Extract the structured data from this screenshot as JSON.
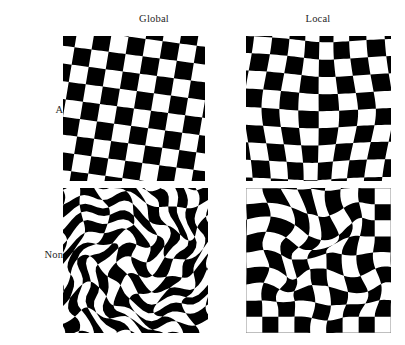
{
  "figure": {
    "background_color": "#ffffff",
    "ink_color": "#000000",
    "label_color": "#262626",
    "width": 405,
    "height": 345
  },
  "columns": [
    {
      "key": "global",
      "label": "Global"
    },
    {
      "key": "local",
      "label": "Local"
    }
  ],
  "rows": [
    {
      "key": "affine",
      "label": "Affine"
    },
    {
      "key": "nonrigid",
      "label": "Nonrigid"
    }
  ],
  "panels": [
    {
      "id": "affine-global",
      "row": "Affine",
      "column": "Global",
      "caption": "Affine / Global",
      "pattern": "checkerboard",
      "grid_cells": 8,
      "x": 63,
      "y": 36,
      "width": 142,
      "height": 145,
      "warp": {
        "type": "affine",
        "scope": "global",
        "shear_x": -0.17,
        "shear_y": 0.13,
        "scale_x": 1.0,
        "scale_y": 1.0,
        "rotation_deg": 0,
        "swirl_strength": 0,
        "local_blobs": []
      }
    },
    {
      "id": "affine-local",
      "row": "Affine",
      "column": "Local",
      "caption": "Affine / Local",
      "pattern": "checkerboard",
      "grid_cells": 8,
      "x": 246,
      "y": 36,
      "width": 145,
      "height": 145,
      "warp": {
        "type": "affine",
        "scope": "local",
        "shear_x": 0.0,
        "shear_y": 0.0,
        "scale_x": 1.0,
        "scale_y": 1.0,
        "rotation_deg": 0,
        "swirl_strength": 0,
        "piecewise_quadrants": [
          {
            "cx": 0.25,
            "cy": 0.25,
            "shear_x": -0.22,
            "shear_y": 0.1,
            "dx": 0.01,
            "dy": -0.01
          },
          {
            "cx": 0.75,
            "cy": 0.25,
            "shear_x": 0.18,
            "shear_y": -0.08,
            "dx": -0.012,
            "dy": 0.012
          },
          {
            "cx": 0.25,
            "cy": 0.75,
            "shear_x": 0.2,
            "shear_y": 0.06,
            "dx": 0.008,
            "dy": 0.006
          },
          {
            "cx": 0.75,
            "cy": 0.75,
            "shear_x": -0.26,
            "shear_y": -0.05,
            "dx": -0.006,
            "dy": -0.008
          }
        ],
        "local_blobs": []
      }
    },
    {
      "id": "nonrigid-global",
      "row": "Nonrigid",
      "column": "Global",
      "caption": "Nonrigid / Global",
      "pattern": "checkerboard",
      "grid_cells": 10,
      "x": 63,
      "y": 188,
      "width": 145,
      "height": 145,
      "warp": {
        "type": "nonrigid",
        "scope": "global",
        "shear_x": 0.0,
        "shear_y": 0.0,
        "swirl_strength": 1.55,
        "swirl_radius": 0.62,
        "swirl_center": [
          0.5,
          0.5
        ],
        "ripple_amp": 0.03,
        "ripple_freq": 3.2,
        "local_blobs": []
      }
    },
    {
      "id": "nonrigid-local",
      "row": "Nonrigid",
      "column": "Local",
      "caption": "Nonrigid / Local",
      "pattern": "checkerboard",
      "grid_cells": 9,
      "x": 246,
      "y": 188,
      "width": 145,
      "height": 145,
      "warp": {
        "type": "nonrigid",
        "scope": "local",
        "shear_x": 0.0,
        "shear_y": 0.0,
        "swirl_strength": 0,
        "ripple_amp": 0.0,
        "local_blobs": [
          {
            "cx": 0.3,
            "cy": 0.28,
            "radius": 0.34,
            "strength": 0.085,
            "rotate": 0.85
          },
          {
            "cx": 0.62,
            "cy": 0.18,
            "radius": 0.26,
            "strength": 0.06,
            "rotate": -0.55
          },
          {
            "cx": 0.22,
            "cy": 0.6,
            "radius": 0.24,
            "strength": 0.055,
            "rotate": 0.7
          },
          {
            "cx": 0.8,
            "cy": 0.62,
            "radius": 0.28,
            "strength": 0.048,
            "rotate": -0.45
          },
          {
            "cx": 0.5,
            "cy": 0.82,
            "radius": 0.22,
            "strength": 0.032,
            "rotate": 0.3
          }
        ]
      }
    }
  ]
}
